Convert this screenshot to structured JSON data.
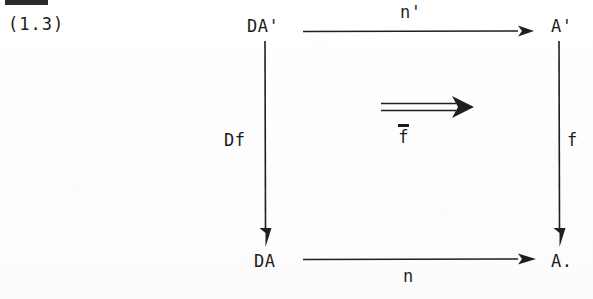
{
  "figure": {
    "equation_number": "(1.3)",
    "edge_mark": "cropped-rule-mark",
    "type": "commutative-diagram"
  },
  "nodes": {
    "top_left": "DA'",
    "top_right": "A'",
    "bottom_left": "DA",
    "bottom_right": "A."
  },
  "arrows": {
    "top": {
      "label": "n'",
      "direction": "right",
      "style": "single"
    },
    "bottom": {
      "label": "n",
      "direction": "right",
      "style": "single"
    },
    "left": {
      "label": "Df",
      "direction": "down",
      "style": "single"
    },
    "right": {
      "label": "f",
      "direction": "down",
      "style": "single"
    },
    "center": {
      "label_overbar": "¯",
      "label_glyph": "f",
      "direction": "right",
      "style": "double"
    }
  },
  "colors": {
    "ink": "#1f1f1f",
    "paper": "#fefefe"
  }
}
